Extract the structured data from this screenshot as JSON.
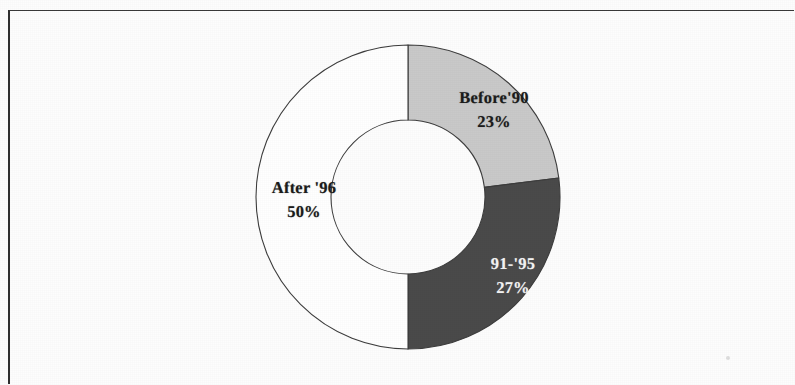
{
  "figure": {
    "background_color": "#fdfdfd",
    "frame_color": "#2f2f2f",
    "alt_title": "Donut chart of respondents by period"
  },
  "chart_data": {
    "type": "pie",
    "variant": "donut",
    "title": "",
    "subtitle": "",
    "xlabel": "",
    "ylabel": "",
    "legend": "none",
    "labels_inside_slices": true,
    "start_angle_deg": 0,
    "direction": "clockwise",
    "center": {
      "x": 408,
      "y": 197
    },
    "outer_radius": 152,
    "inner_radius": 77,
    "categories": [
      "Before'90",
      "91-'95",
      "After '96"
    ],
    "values": [
      23,
      27,
      50
    ],
    "value_unit": "%",
    "colors": [
      "#c9c9c9",
      "#4a4a4a",
      "#ffffff"
    ],
    "slices": [
      {
        "name": "Before'90",
        "value": 23,
        "display_value": "23%",
        "fill": "#c9c9c9",
        "text_color": "#1c1c1c",
        "start_angle_deg": 0,
        "end_angle_deg": 82.8
      },
      {
        "name": "91-'95",
        "value": 27,
        "display_value": "27%",
        "fill": "#4a4a4a",
        "text_color": "#f4f4f4",
        "start_angle_deg": 82.8,
        "end_angle_deg": 180.0
      },
      {
        "name": "After '96",
        "value": 50,
        "display_value": "50%",
        "fill": "#ffffff",
        "text_color": "#1c1c1c",
        "start_angle_deg": 180.0,
        "end_angle_deg": 360.0
      }
    ],
    "stroke_color": "#3d3d3d",
    "stroke_width": 1.1
  }
}
